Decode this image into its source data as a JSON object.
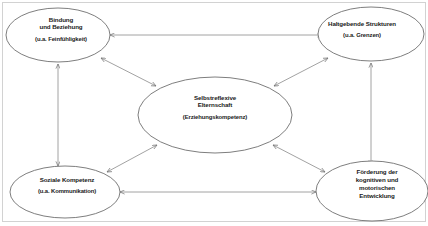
{
  "diagram": {
    "background_color": "#ffffff",
    "stroke_color": "#8a8a8a",
    "text_color": "#1a1a1a",
    "nodes": [
      {
        "id": "bindung",
        "title_line1": "Bindung",
        "title_line2": "und Beziehung",
        "subtitle": "(u.a. Feinfühligkeit)",
        "position": "top-left"
      },
      {
        "id": "haltgebende-strukturen",
        "title_line1": "Haltgebende Strukturen",
        "title_line2": "",
        "subtitle": "(u.a. Grenzen)",
        "position": "top-right"
      },
      {
        "id": "selbstreflexive-elternschaft",
        "title_line1": "Selbstreflexive",
        "title_line2": "Elternschaft",
        "subtitle": "(Erziehungskompetenz)",
        "position": "center"
      },
      {
        "id": "soziale-kompetenz",
        "title_line1": "Soziale Kompetenz",
        "title_line2": "",
        "subtitle": "(u.a. Kommunikation)",
        "position": "bottom-left"
      },
      {
        "id": "foerderung-entwicklung",
        "title_line1": "Förderung der",
        "title_line2": "kognitiven und",
        "title_line3": "motorischen",
        "title_line4": "Entwicklung",
        "subtitle": "",
        "position": "bottom-right"
      }
    ],
    "connections": [
      {
        "from": "bindung",
        "to": "haltgebende-strukturen",
        "style": "bidirectional"
      },
      {
        "from": "bindung",
        "to": "soziale-kompetenz",
        "style": "bidirectional"
      },
      {
        "from": "haltgebende-strukturen",
        "to": "foerderung-entwicklung",
        "style": "bidirectional"
      },
      {
        "from": "soziale-kompetenz",
        "to": "foerderung-entwicklung",
        "style": "bidirectional"
      },
      {
        "from": "bindung",
        "to": "selbstreflexive-elternschaft",
        "style": "bidirectional"
      },
      {
        "from": "haltgebende-strukturen",
        "to": "selbstreflexive-elternschaft",
        "style": "bidirectional"
      },
      {
        "from": "soziale-kompetenz",
        "to": "selbstreflexive-elternschaft",
        "style": "bidirectional"
      },
      {
        "from": "foerderung-entwicklung",
        "to": "selbstreflexive-elternschaft",
        "style": "bidirectional"
      }
    ]
  }
}
